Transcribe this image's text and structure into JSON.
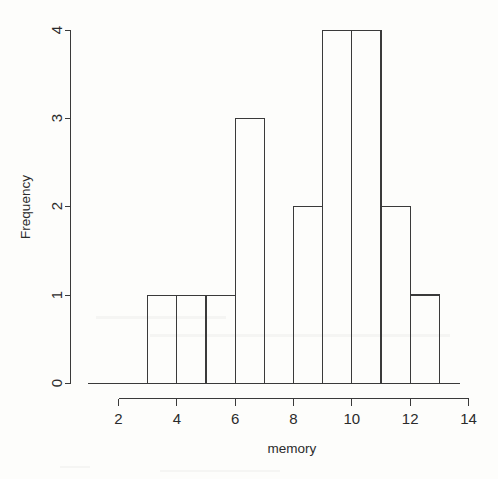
{
  "figure": {
    "kind": "histogram",
    "background_color": "#fdfdfb",
    "ink_color": "#3a3a3a"
  },
  "axes": {
    "x_title": "memory",
    "y_title": "Frequency",
    "x_ticks": [
      "2",
      "4",
      "6",
      "8",
      "10",
      "12",
      "14"
    ],
    "y_ticks": [
      "0",
      "1",
      "2",
      "3",
      "4"
    ]
  },
  "chart_data": {
    "type": "bar",
    "title": "",
    "subtitle": "",
    "xlabel": "memory",
    "ylabel": "Frequency",
    "xlim": [
      2,
      14
    ],
    "ylim": [
      0,
      4
    ],
    "xticks": [
      2,
      4,
      6,
      8,
      10,
      12,
      14
    ],
    "yticks": [
      0,
      1,
      2,
      3,
      4
    ],
    "grid": false,
    "legend": null,
    "bin_width": 1,
    "bin_edges": [
      2,
      3,
      4,
      5,
      6,
      7,
      8,
      9,
      10,
      11,
      12,
      13
    ],
    "categories": [
      "2-3",
      "3-4",
      "4-5",
      "5-6",
      "6-7",
      "7-8",
      "8-9",
      "9-10",
      "10-11",
      "11-12",
      "12-13"
    ],
    "values": [
      1,
      1,
      1,
      1,
      3,
      0,
      2,
      4,
      4,
      2,
      1
    ],
    "total_count": 20,
    "bars": [
      {
        "left": 2,
        "right": 3,
        "frequency": 1
      },
      {
        "left": 3,
        "right": 4,
        "frequency": 1
      },
      {
        "left": 4,
        "right": 5,
        "frequency": 1
      },
      {
        "left": 5,
        "right": 6,
        "frequency": 1
      },
      {
        "left": 6,
        "right": 7,
        "frequency": 3
      },
      {
        "left": 7,
        "right": 8,
        "frequency": 0
      },
      {
        "left": 8,
        "right": 9,
        "frequency": 2
      },
      {
        "left": 9,
        "right": 10,
        "frequency": 4
      },
      {
        "left": 10,
        "right": 11,
        "frequency": 4
      },
      {
        "left": 11,
        "right": 12,
        "frequency": 2
      },
      {
        "left": 12,
        "right": 13,
        "frequency": 1
      }
    ]
  }
}
